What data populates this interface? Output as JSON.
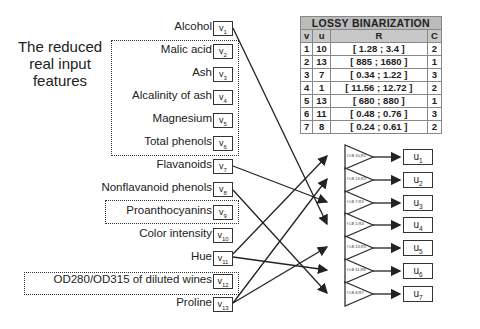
{
  "side_title": "The reduced real input features",
  "features": [
    {
      "label": "Alcohol",
      "var": "v",
      "idx": "1",
      "y": 76
    },
    {
      "label": "Malic acid",
      "var": "v",
      "idx": "2",
      "y": 98
    },
    {
      "label": "Ash",
      "var": "v",
      "idx": "3",
      "y": 120
    },
    {
      "label": "Alcalinity of ash",
      "var": "v",
      "idx": "4",
      "y": 143
    },
    {
      "label": "Magnesium",
      "var": "v",
      "idx": "5",
      "y": 165
    },
    {
      "label": "Total phenols",
      "var": "v",
      "idx": "6",
      "y": 188
    },
    {
      "label": "Flavanoids",
      "var": "v",
      "idx": "7",
      "y": 210
    },
    {
      "label": "Nonflavanoid phenols",
      "var": "v",
      "idx": "8",
      "y": 233
    },
    {
      "label": "Proanthocyanins",
      "var": "v",
      "idx": "9",
      "y": 255
    },
    {
      "label": "Color intensity",
      "var": "v",
      "idx": "10",
      "y": 278
    },
    {
      "label": "Hue",
      "var": "v",
      "idx": "11",
      "y": 300
    },
    {
      "label": "OD280/OD315 of diluted wines",
      "var": "v",
      "idx": "12",
      "y": 322
    },
    {
      "label": "Proline",
      "var": "v",
      "idx": "13",
      "y": 345
    }
  ],
  "table": {
    "title": "LOSSY BINARIZATION",
    "headers": [
      "v",
      "u",
      "R",
      "C"
    ],
    "rows": [
      [
        "1",
        "10",
        "[ 1.28 ; 3.4 ]",
        "2"
      ],
      [
        "2",
        "13",
        "[ 885 ; 1680 ]",
        "1"
      ],
      [
        "3",
        "7",
        "[ 0.34 ; 1.22 ]",
        "3"
      ],
      [
        "4",
        "1",
        "[ 11.56 ; 12.72 ]",
        "2"
      ],
      [
        "5",
        "13",
        "[ 680 ; 880 ]",
        "1"
      ],
      [
        "6",
        "11",
        "[ 0.48 ; 0.76 ]",
        "3"
      ],
      [
        "7",
        "8",
        "[ 0.24 ; 0.61 ]",
        "2"
      ]
    ]
  },
  "binarizers": [
    {
      "label": "f LB 10,R1",
      "output": "u",
      "idx": "1",
      "source": 10
    },
    {
      "label": "f LB 13,R2",
      "output": "u",
      "idx": "2",
      "source": 13
    },
    {
      "label": "f LB 7,R3",
      "output": "u",
      "idx": "3",
      "source": 7
    },
    {
      "label": "f LB 1,R4",
      "output": "u",
      "idx": "4",
      "source": 1
    },
    {
      "label": "f LB 13,R5",
      "output": "u",
      "idx": "5",
      "source": 13
    },
    {
      "label": "f LB 11,R6",
      "output": "u",
      "idx": "6",
      "source": 11
    },
    {
      "label": "f LB 8,R7",
      "output": "u",
      "idx": "7",
      "source": 8
    }
  ]
}
